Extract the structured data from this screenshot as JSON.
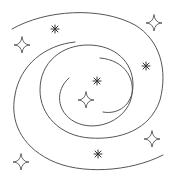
{
  "illustration": {
    "subject": "spiral-galaxy",
    "stroke_color": "#555555",
    "background": "#ffffff",
    "stars_sparkle": [
      {
        "x": 22,
        "y": 45
      },
      {
        "x": 154,
        "y": 23
      },
      {
        "x": 86,
        "y": 100
      },
      {
        "x": 152,
        "y": 139
      },
      {
        "x": 21,
        "y": 162
      }
    ],
    "stars_asterisk": [
      {
        "x": 55,
        "y": 29
      },
      {
        "x": 146,
        "y": 66
      },
      {
        "x": 97,
        "y": 81
      },
      {
        "x": 98,
        "y": 154
      }
    ]
  }
}
